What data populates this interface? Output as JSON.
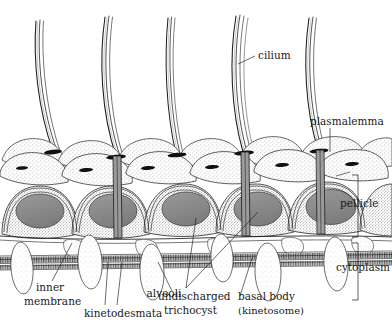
{
  "figure": {
    "background_color": "#ffffff",
    "ink_color": "#1a1a1a",
    "alveoli_fill": "#8a8a8a",
    "stipple_fill": "#d9d5cf",
    "membrane_band_color": "#4a4a4a"
  },
  "labels": {
    "cilium": "cilium",
    "plasmalemma": "plasmalemma",
    "pellicle": "pellicle",
    "cytoplasm": "cytoplasm",
    "alveoli": "alveoli",
    "inner_membrane_line1": "inner",
    "inner_membrane_line2": "membrane",
    "kinetodesmata": "kinetodesmata",
    "trichocyst_line1": "undischarged",
    "trichocyst_line2": "trichocyst",
    "basal_body_line1": "basal body",
    "basal_body_line2": "(kinetosome)"
  },
  "structures": {
    "cilia_count": 5,
    "alveoli_count": 5,
    "trichocyst_count": 6,
    "brackets": [
      "pellicle",
      "cytoplasm"
    ]
  }
}
